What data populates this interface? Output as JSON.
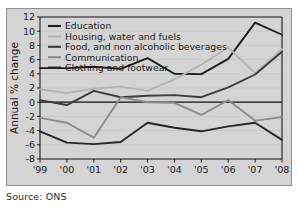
{
  "source_note": "Source: ONS",
  "chart_data": {
    "type": "line",
    "title": "",
    "xlabel": "",
    "ylabel": "Annual % change",
    "x": [
      "'99",
      "'00",
      "'01",
      "'02",
      "'03",
      "'04",
      "'05",
      "'06",
      "'07",
      "'08"
    ],
    "categories": [
      "'99",
      "'00",
      "'01",
      "'02",
      "'03",
      "'04",
      "'05",
      "'06",
      "'07",
      "'08"
    ],
    "ylim": [
      -8,
      12
    ],
    "yticks": [
      12,
      10,
      8,
      6,
      4,
      2,
      0,
      -2,
      -4,
      -6,
      -8
    ],
    "ytick_labels": [
      "12",
      "10",
      "8",
      "6",
      "4",
      "2",
      "0",
      "-2",
      "-4",
      "-6",
      "-8"
    ],
    "grid": true,
    "legend_position": "top-left",
    "zero_line": 0,
    "series": [
      {
        "name": "Education",
        "color": "#1c1c1c",
        "width": 1.9,
        "values": [
          4.8,
          4.8,
          5.0,
          4.7,
          6.2,
          4.0,
          3.95,
          6.1,
          11.2,
          9.5
        ]
      },
      {
        "name": "Housing, water and fuels",
        "color": "#b4b4b4",
        "width": 1.9,
        "values": [
          1.8,
          1.3,
          1.9,
          2.2,
          1.6,
          3.2,
          5.3,
          7.7,
          4.1,
          7.5
        ]
      },
      {
        "name": "Food, and non alcoholic beverages",
        "color": "#3c3c3c",
        "width": 1.9,
        "values": [
          0.3,
          -0.4,
          1.6,
          0.7,
          0.9,
          1.0,
          0.7,
          2.1,
          3.9,
          7.1
        ]
      },
      {
        "name": "Communication",
        "color": "#8c8c8c",
        "width": 1.9,
        "values": [
          -2.2,
          -2.9,
          -5.0,
          0.7,
          0.0,
          -0.1,
          -1.8,
          0.3,
          -2.6,
          -2.1
        ]
      },
      {
        "name": "Clothing and footwear",
        "color": "#252525",
        "width": 1.9,
        "values": [
          -4.1,
          -5.7,
          -5.9,
          -5.6,
          -2.9,
          -3.6,
          -4.1,
          -3.4,
          -2.9,
          -5.3
        ]
      }
    ]
  }
}
